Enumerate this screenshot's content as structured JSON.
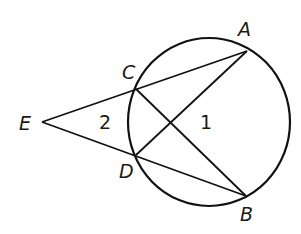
{
  "diagram": {
    "type": "geometry",
    "stroke_color": "#111111",
    "circle": {
      "cx": 209,
      "cy": 122,
      "rx": 81,
      "ry": 84
    },
    "points": {
      "A": {
        "label": "A",
        "x": 247,
        "y": 51
      },
      "B": {
        "label": "B",
        "x": 246,
        "y": 196
      },
      "C": {
        "label": "C",
        "x": 136,
        "y": 89
      },
      "D": {
        "label": "D",
        "x": 136,
        "y": 155
      },
      "E": {
        "label": "E",
        "x": 42,
        "y": 122
      }
    },
    "segments": [
      [
        "E",
        "A"
      ],
      [
        "E",
        "B"
      ],
      [
        "A",
        "D"
      ],
      [
        "C",
        "B"
      ]
    ],
    "angles": {
      "angle1": {
        "label": "1"
      },
      "angle2": {
        "label": "2"
      }
    }
  }
}
